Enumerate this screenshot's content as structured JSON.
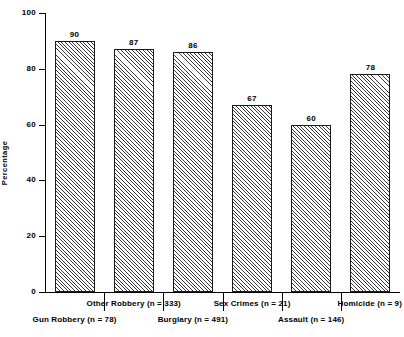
{
  "chart_data": {
    "type": "bar",
    "title": "",
    "subtitle": "",
    "xlabel": "",
    "ylabel": "Percentage",
    "ylim": [
      0,
      100
    ],
    "yticks": [
      0,
      20,
      40,
      60,
      80,
      100
    ],
    "ytick_labels": [
      "0",
      "20",
      "40",
      "60",
      "80",
      "100"
    ],
    "grid": false,
    "legend": null,
    "categories": [
      "Gun Robbery (n = 78)",
      "Other Robbery (n = 333)",
      "Burglary (n = 491)",
      "Sex Crimes (n = 21)",
      "Assault (n = 146)",
      "Homicide (n = 9)"
    ],
    "values": [
      90,
      87,
      86,
      67,
      60,
      78
    ],
    "value_labels": [
      "90",
      "87",
      "86",
      "67",
      "60",
      "78"
    ],
    "bar_style": {
      "fill": "diagonal-hatch",
      "hatch_color": "#3a3a3a",
      "background": "#ffffff",
      "edge_color": "#1a1a1a"
    },
    "category_label_rows": [
      1,
      0,
      1,
      0,
      1,
      0
    ]
  },
  "axes": {
    "y_title": "Percentage"
  }
}
